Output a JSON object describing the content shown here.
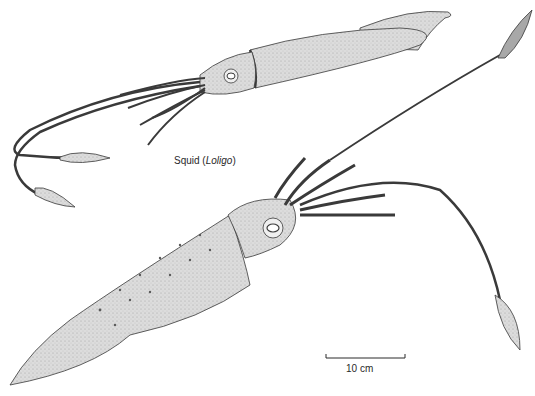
{
  "figure": {
    "caption": {
      "prefix": "Squid (",
      "genus": "Loligo",
      "suffix": ")"
    },
    "scale_bar": {
      "label": "10 cm"
    },
    "illustrations": [
      {
        "name": "small-squid",
        "view": "top-left, facing left"
      },
      {
        "name": "large-squid",
        "view": "center, facing upper-right"
      }
    ],
    "colors": {
      "body_fill": "#d9d9d9",
      "outline": "#3a3a3a",
      "background": "#ffffff"
    }
  }
}
